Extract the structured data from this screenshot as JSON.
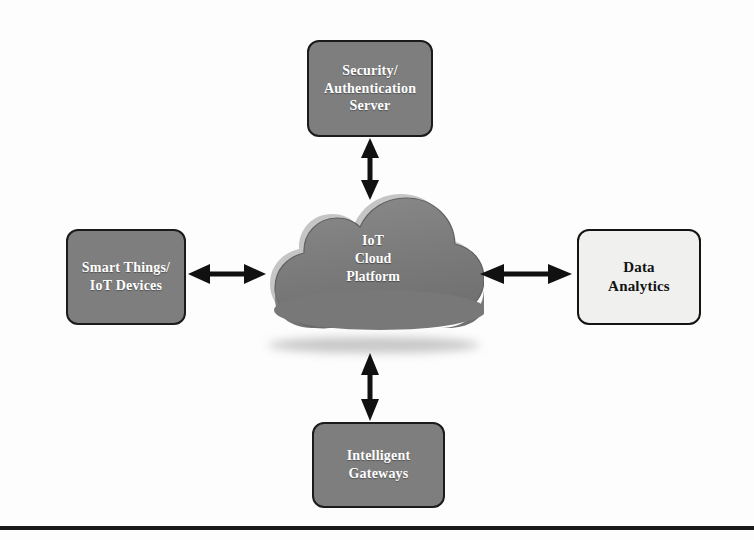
{
  "diagram": {
    "background_color": "#fdfdfd",
    "nodes": {
      "security": {
        "label": "Security/\nAuthentication\nServer",
        "style": "filled",
        "fill_color": "#7e7e7e",
        "border_color": "#1b1b1b",
        "text_color": "#ffffff"
      },
      "smart_things": {
        "label": "Smart Things/\nIoT Devices",
        "style": "filled",
        "fill_color": "#7e7e7e",
        "border_color": "#1b1b1b",
        "text_color": "#ffffff"
      },
      "cloud": {
        "label": "IoT\nCloud\nPlatform",
        "style": "cloud",
        "fill_color": "#7b7b7b",
        "highlight_color": "#b9b9b9",
        "outline_color": "#5d5d5d",
        "text_color": "#ffffff"
      },
      "data_analytics": {
        "label": "Data\nAnalytics",
        "style": "light",
        "fill_color": "#f0f0ee",
        "border_color": "#141414",
        "text_color": "#131313"
      },
      "gateways": {
        "label": "Intelligent\nGateways",
        "style": "filled",
        "fill_color": "#7e7e7e",
        "border_color": "#1b1b1b",
        "text_color": "#ffffff"
      }
    },
    "connectors": [
      {
        "id": "security-cloud",
        "from": "security",
        "to": "cloud",
        "orientation": "vertical",
        "arrowheads": "both",
        "color": "#111111"
      },
      {
        "id": "smart-cloud",
        "from": "smart_things",
        "to": "cloud",
        "orientation": "horizontal",
        "arrowheads": "both",
        "color": "#111111"
      },
      {
        "id": "cloud-data",
        "from": "cloud",
        "to": "data_analytics",
        "orientation": "horizontal",
        "arrowheads": "both",
        "color": "#111111"
      },
      {
        "id": "cloud-gateways",
        "from": "cloud",
        "to": "gateways",
        "orientation": "vertical",
        "arrowheads": "both",
        "color": "#111111"
      }
    ],
    "footer_rule": {
      "color": "#1a1a1a"
    }
  }
}
